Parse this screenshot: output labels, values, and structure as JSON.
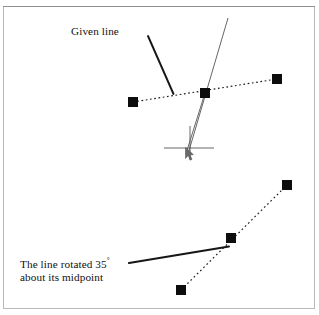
{
  "figure": {
    "title_alt": "Line rotation illustration",
    "background_color": "#ffffff",
    "border_color": "#b9b9b9",
    "ink_color": "#111111",
    "handle_color": "#0d0d0d"
  },
  "annotations": {
    "given_line_label": "Given line",
    "rotated_label_line1": "The line rotated 35",
    "rotated_degree_symbol": "°",
    "rotated_label_line2": "about its midpoint",
    "rotation_degrees": 35
  },
  "diagrams": {
    "upper": {
      "name": "given-line-with-rubber-band",
      "selected_line": {
        "style": "dotted",
        "endpoints": [
          [
            133,
            102
          ],
          [
            277,
            79
          ]
        ],
        "midpoint": [
          205,
          93
        ]
      },
      "handles": [
        {
          "name": "handle-left",
          "x": 133,
          "y": 102,
          "size": 10
        },
        {
          "name": "handle-mid",
          "x": 205,
          "y": 93,
          "size": 10
        },
        {
          "name": "handle-right",
          "x": 277,
          "y": 79,
          "size": 10
        }
      ],
      "rubber_band_lines": [
        {
          "name": "drag-line-long",
          "from": [
            228,
            18
          ],
          "to": [
            188,
            154
          ]
        },
        {
          "name": "drag-line-short",
          "from": [
            205,
            93
          ],
          "to": [
            186,
            152
          ]
        }
      ],
      "cursor": {
        "name": "crosshair-cursor",
        "center": [
          190,
          148
        ],
        "arm_left": 26,
        "arm_right": 24,
        "arm_up": 22,
        "arm_down": 12
      },
      "leader": {
        "name": "given-line-leader",
        "from": [
          148,
          36
        ],
        "to": [
          173,
          94
        ]
      }
    },
    "lower": {
      "name": "rotated-line",
      "selected_line": {
        "style": "dotted",
        "endpoints": [
          [
            181,
            290
          ],
          [
            287,
            185
          ]
        ],
        "midpoint": [
          231,
          238
        ]
      },
      "handles": [
        {
          "name": "handle-lower-left",
          "x": 181,
          "y": 290,
          "size": 10
        },
        {
          "name": "handle-lower-mid",
          "x": 231,
          "y": 238,
          "size": 10
        },
        {
          "name": "handle-lower-right",
          "x": 287,
          "y": 185,
          "size": 10
        }
      ],
      "leader": {
        "name": "rotated-line-leader",
        "from": [
          129,
          263
        ],
        "to": [
          228,
          247
        ]
      }
    }
  }
}
